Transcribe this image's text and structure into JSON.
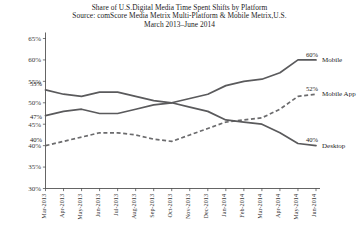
{
  "chart_data": {
    "type": "line",
    "title": "Share of U.S.Digital Media Time Spent Shifts by Platform",
    "subtitle": "Source:  comScore Media Metrix Multi-Platform & Mobile Metrix,U.S.",
    "subtitle2": "March 2013–June 2014",
    "xlabel": "",
    "ylabel": "",
    "ylim": [
      30,
      65
    ],
    "ytick_labels": [
      "65%",
      "60%",
      "55%",
      "50%",
      "45%",
      "40%",
      "35%",
      "30%"
    ],
    "ytick_values": [
      65,
      60,
      55,
      50,
      45,
      40,
      35,
      30
    ],
    "grid": false,
    "legend_position": "right",
    "categories": [
      "Mar-2013",
      "Apr-2013",
      "May-2013",
      "Jun-2013",
      "Jul-2013",
      "Aug-2013",
      "Sep-2013",
      "Oct-2013",
      "Nov-2013",
      "Dec-2013",
      "Jan-2014",
      "Feb-2014",
      "Mar-2014",
      "Apr-2014",
      "May-2014",
      "Jun-2014"
    ],
    "series": [
      {
        "name": "Mobile",
        "style": "solid",
        "color": "#5a5a5c",
        "values": [
          47,
          48,
          48.5,
          47.5,
          47.5,
          48.5,
          49.5,
          50,
          51,
          52,
          54,
          55,
          55.5,
          57,
          60,
          60
        ],
        "start_label": "47%",
        "end_label": "60%"
      },
      {
        "name": "Mobile App",
        "style": "dashed",
        "color": "#6b6b6d",
        "values": [
          40,
          41,
          42,
          43,
          43,
          42.5,
          41.5,
          41,
          42.5,
          44,
          45.5,
          46,
          46.5,
          48.5,
          51.5,
          52
        ],
        "start_label": "40%",
        "end_label": "52%"
      },
      {
        "name": "Desktop",
        "style": "solid",
        "color": "#5a5a5c",
        "values": [
          53,
          52,
          51.5,
          52.5,
          52.5,
          51.5,
          50.5,
          50,
          49,
          48,
          46,
          45.5,
          45,
          43,
          40.5,
          40
        ],
        "start_label": "53%",
        "end_label": "40%"
      }
    ],
    "series_labels": [
      {
        "name": "Mobile",
        "value": 60
      },
      {
        "name": "Mobile App",
        "value": 52
      },
      {
        "name": "Desktop",
        "value": 40
      }
    ]
  }
}
